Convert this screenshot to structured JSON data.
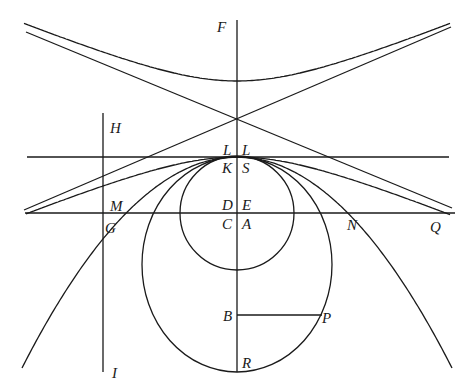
{
  "labels": {
    "F": "F",
    "H": "H",
    "L_left": "L",
    "L_right": "L",
    "K": "K",
    "S": "S",
    "D": "D",
    "E": "E",
    "C": "C",
    "A": "A",
    "M": "M",
    "G": "G",
    "N": "N",
    "Q": "Q",
    "B": "B",
    "P": "P",
    "R": "R",
    "I": "I"
  },
  "curves": [
    "hyperbola-upper-branch",
    "hyperbola-lower-branch",
    "asymptotes",
    "circle",
    "ellipse",
    "parabola",
    "tangent-line-at-vertex",
    "horizontal-line-MNQ",
    "vertical-axis-FR",
    "vertical-line-HI",
    "segment-BP"
  ],
  "colors": {
    "stroke": "#1a1a1a",
    "background": "#ffffff"
  }
}
